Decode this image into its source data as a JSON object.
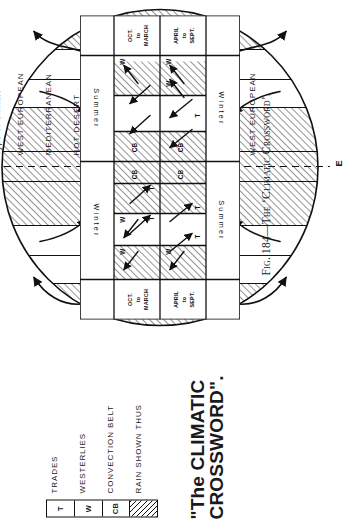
{
  "figure": {
    "title_line1": "\"The CLIMATIC",
    "title_line2": "CROSSWORD\".",
    "caption": "Fig. 184—The ‘Climatic Crossword’."
  },
  "legend": {
    "symbols": [
      "T",
      "W",
      "CB",
      ""
    ],
    "items": [
      {
        "symbol": "T",
        "label": "TRADES"
      },
      {
        "symbol": "W",
        "label": "WESTERLIES"
      },
      {
        "symbol": "CB",
        "label": "CONVECTION BELT"
      },
      {
        "symbol": "",
        "label": "RAIN SHOWN THUS"
      }
    ]
  },
  "axis": {
    "column_header": "Type of Climate",
    "equator_label_top": "EQUATORIAL",
    "equator_marker_top": "Q",
    "equator_marker_bottom": "E"
  },
  "climate_bands": [
    {
      "name": "WEST EUROPEAN",
      "rain": true
    },
    {
      "name": "MEDITERRANEAN",
      "rain": false
    },
    {
      "name": "HOT DESERT",
      "rain": false
    },
    {
      "name": "TROPICAL or SUDAN",
      "rain": true
    },
    {
      "name": "EQUATORIAL",
      "rain": true
    },
    {
      "name": "TROPICAL or SUDAN",
      "rain": true
    },
    {
      "name": "HOT DESERT",
      "rain": false
    },
    {
      "name": "MEDITERRANEAN",
      "rain": false
    },
    {
      "name": "WEST EUROPEAN",
      "rain": true
    }
  ],
  "grid": {
    "row_labels": [
      {
        "l1": "OCT.",
        "l2": "to",
        "l3": "MARCH"
      },
      {
        "l1": "APRIL",
        "l2": "to",
        "l3": "SEPT."
      }
    ],
    "season_labels": {
      "north_top": "Winter",
      "north_bottom": "Summer",
      "south_top": "Summer",
      "south_bottom": "Winter"
    },
    "rows": [
      {
        "period": "OCT. to MARCH",
        "cells": [
          "W",
          "W",
          "T",
          "T",
          "CB",
          "CB",
          "",
          "",
          "W"
        ]
      },
      {
        "period": "APRIL to SEPT.",
        "cells": [
          "W",
          "T",
          "T",
          "CB",
          "CB",
          "",
          "T",
          "W",
          "W"
        ]
      }
    ]
  },
  "colors": {
    "ink": "#111111",
    "paper": "#ffffff"
  }
}
